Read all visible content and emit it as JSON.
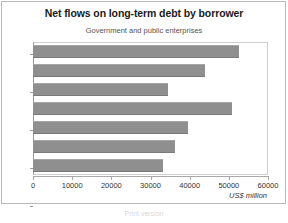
{
  "chart_data": {
    "type": "bar",
    "orientation": "horizontal",
    "title": "Net flows on long-term debt by borrower",
    "subtitle": "Government and public enterprises",
    "xlabel": "US$ million",
    "ylabel": "",
    "xlim": [
      0,
      60000
    ],
    "xticks": [
      "0",
      "10000",
      "20000",
      "30000",
      "40000",
      "50000",
      "60000"
    ],
    "xtick_values": [
      0,
      10000,
      20000,
      30000,
      40000,
      50000,
      60000
    ],
    "grid": false,
    "legend": null,
    "bar_color": "#8f8f8f",
    "categories": [
      "1996",
      "1995",
      "1994",
      "1993",
      "1992",
      "1991",
      "1990"
    ],
    "values": [
      52600,
      43800,
      34400,
      50800,
      39500,
      36200,
      33100
    ],
    "series": [
      {
        "name": "Government and public enterprises",
        "values": [
          52600,
          43800,
          34400,
          50800,
          39500,
          36200,
          33100
        ]
      }
    ]
  },
  "footer": {
    "note": "Print version"
  },
  "colors": {
    "bar": "#8f8f8f",
    "frame": "#b9b9b9",
    "axis": "#a8a8a8",
    "title_text": "#1b1b1b",
    "subtitle_text": "#555555"
  }
}
